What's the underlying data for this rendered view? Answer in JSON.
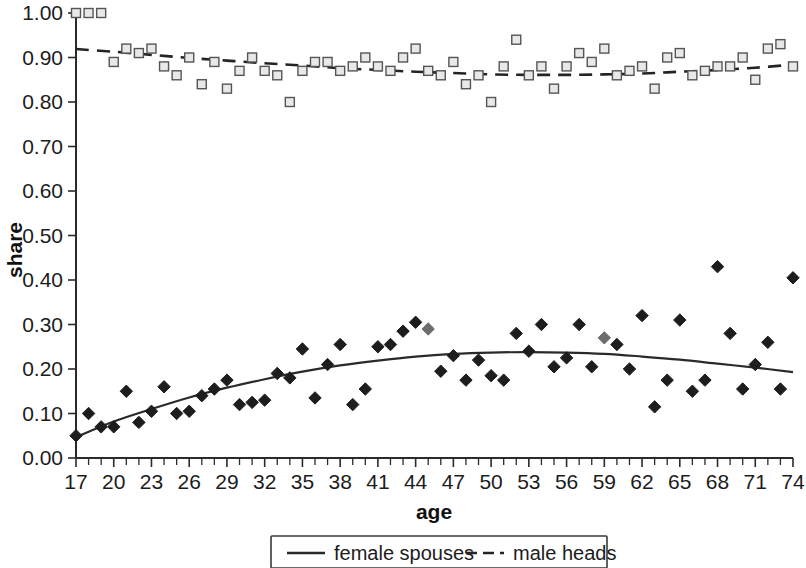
{
  "chart_data": {
    "type": "scatter",
    "title": "",
    "xlabel": "age",
    "ylabel": "share",
    "xlim": [
      17,
      74
    ],
    "ylim": [
      0.0,
      1.0
    ],
    "grid": false,
    "legend_position": "bottom-center",
    "y_ticks": [
      "0.00",
      "0.10",
      "0.20",
      "0.30",
      "0.40",
      "0.50",
      "0.60",
      "0.70",
      "0.80",
      "0.90",
      "1.00"
    ],
    "y_tick_values": [
      0.0,
      0.1,
      0.2,
      0.3,
      0.4,
      0.5,
      0.6,
      0.7,
      0.8,
      0.9,
      1.0
    ],
    "x_ticks": [
      "17",
      "20",
      "23",
      "26",
      "29",
      "32",
      "35",
      "38",
      "41",
      "44",
      "47",
      "50",
      "53",
      "56",
      "59",
      "62",
      "65",
      "68",
      "71",
      "74"
    ],
    "x_tick_values": [
      17,
      20,
      23,
      26,
      29,
      32,
      35,
      38,
      41,
      44,
      47,
      50,
      53,
      56,
      59,
      62,
      65,
      68,
      71,
      74
    ],
    "x_minor_step": 1,
    "series": [
      {
        "name": "male heads",
        "marker": "open-square",
        "line_style": "dashed",
        "color": "#555555",
        "x": [
          17,
          18,
          19,
          20,
          21,
          22,
          23,
          24,
          25,
          26,
          27,
          28,
          29,
          30,
          31,
          32,
          33,
          34,
          35,
          36,
          37,
          38,
          39,
          40,
          41,
          42,
          43,
          44,
          45,
          46,
          47,
          48,
          49,
          50,
          51,
          52,
          53,
          54,
          55,
          56,
          57,
          58,
          59,
          60,
          61,
          62,
          63,
          64,
          65,
          66,
          67,
          68,
          69,
          70,
          71,
          72,
          73,
          74
        ],
        "y": [
          1.0,
          1.0,
          1.0,
          0.89,
          0.92,
          0.91,
          0.92,
          0.88,
          0.86,
          0.9,
          0.84,
          0.89,
          0.83,
          0.87,
          0.9,
          0.87,
          0.86,
          0.8,
          0.87,
          0.89,
          0.89,
          0.87,
          0.88,
          0.9,
          0.88,
          0.87,
          0.9,
          0.92,
          0.87,
          0.86,
          0.89,
          0.84,
          0.86,
          0.8,
          0.88,
          0.94,
          0.86,
          0.88,
          0.83,
          0.88,
          0.91,
          0.89,
          0.92,
          0.86,
          0.87,
          0.88,
          0.83,
          0.9,
          0.91,
          0.86,
          0.87,
          0.88,
          0.88,
          0.9,
          0.85,
          0.92,
          0.93,
          0.88
        ],
        "trend": {
          "kind": "quadratic",
          "x": [
            17,
            20,
            23,
            26,
            29,
            32,
            35,
            38,
            41,
            44,
            47,
            50,
            53,
            56,
            59,
            62,
            65,
            68,
            71,
            74
          ],
          "y": [
            0.919,
            0.913,
            0.906,
            0.899,
            0.893,
            0.887,
            0.882,
            0.876,
            0.872,
            0.868,
            0.865,
            0.862,
            0.861,
            0.861,
            0.862,
            0.864,
            0.868,
            0.872,
            0.877,
            0.884
          ]
        }
      },
      {
        "name": "female spouses",
        "marker": "filled-diamond",
        "line_style": "solid",
        "color": "#1d1d1d",
        "x": [
          17,
          18,
          19,
          20,
          21,
          22,
          23,
          24,
          25,
          26,
          27,
          28,
          29,
          30,
          31,
          32,
          33,
          34,
          35,
          36,
          37,
          38,
          39,
          40,
          41,
          42,
          43,
          44,
          45,
          46,
          47,
          48,
          49,
          50,
          51,
          52,
          53,
          54,
          55,
          56,
          57,
          58,
          59,
          60,
          61,
          62,
          63,
          64,
          65,
          66,
          67,
          68,
          69,
          70,
          71,
          72,
          73,
          74
        ],
        "y": [
          0.05,
          0.1,
          0.07,
          0.07,
          0.15,
          0.08,
          0.105,
          0.16,
          0.1,
          0.105,
          0.14,
          0.155,
          0.175,
          0.12,
          0.125,
          0.13,
          0.19,
          0.18,
          0.245,
          0.135,
          0.21,
          0.255,
          0.12,
          0.155,
          0.25,
          0.255,
          0.285,
          0.305,
          0.29,
          0.195,
          0.23,
          0.175,
          0.22,
          0.185,
          0.175,
          0.28,
          0.24,
          0.3,
          0.205,
          0.225,
          0.3,
          0.205,
          0.27,
          0.255,
          0.2,
          0.32,
          0.115,
          0.175,
          0.31,
          0.15,
          0.175,
          0.43,
          0.28,
          0.155,
          0.21,
          0.26,
          0.155,
          0.405
        ],
        "trend": {
          "kind": "quadratic",
          "x": [
            17,
            20,
            23,
            26,
            29,
            32,
            35,
            38,
            41,
            44,
            47,
            50,
            53,
            56,
            59,
            62,
            65,
            68,
            71,
            74
          ],
          "y": [
            0.047,
            0.082,
            0.11,
            0.136,
            0.158,
            0.177,
            0.194,
            0.208,
            0.219,
            0.228,
            0.234,
            0.237,
            0.238,
            0.237,
            0.234,
            0.228,
            0.221,
            0.212,
            0.203,
            0.193
          ]
        }
      }
    ],
    "legend": [
      {
        "label": "female spouses",
        "style": "solid"
      },
      {
        "label": "male heads",
        "style": "dashed"
      }
    ]
  }
}
